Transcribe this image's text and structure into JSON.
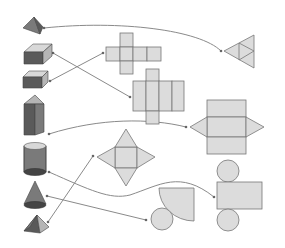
{
  "diagram": {
    "background": "#ffffff",
    "colors": {
      "net_fill": "#dcdcdc",
      "net_stroke": "#777777",
      "solid_dark": "#5a5a5a",
      "connector": "#8a8a8a"
    },
    "solids": [
      {
        "id": "tetrahedron",
        "label": "Triangular pyramid (tetrahedron)"
      },
      {
        "id": "rect-prism",
        "label": "Rectangular prism"
      },
      {
        "id": "cube",
        "label": "Cube"
      },
      {
        "id": "tri-prism",
        "label": "Triangular prism"
      },
      {
        "id": "cylinder",
        "label": "Cylinder"
      },
      {
        "id": "cone",
        "label": "Cone"
      },
      {
        "id": "square-pyramid",
        "label": "Square pyramid"
      }
    ],
    "nets": [
      {
        "id": "net-cube",
        "label": "Cube net (cross of 6 squares)"
      },
      {
        "id": "net-rect-prism",
        "label": "Rectangular prism net"
      },
      {
        "id": "net-tetrahedron",
        "label": "Tetrahedron net (4 triangles)"
      },
      {
        "id": "net-tri-prism",
        "label": "Triangular prism net"
      },
      {
        "id": "net-square-pyramid",
        "label": "Square pyramid net"
      },
      {
        "id": "net-cylinder",
        "label": "Cylinder net (rectangle + 2 circles)"
      },
      {
        "id": "net-cone",
        "label": "Cone net (sector + circle)"
      }
    ],
    "connections": [
      {
        "from": "tetrahedron",
        "to": "net-tetrahedron"
      },
      {
        "from": "rect-prism",
        "to": "net-rect-prism"
      },
      {
        "from": "cube",
        "to": "net-cube"
      },
      {
        "from": "tri-prism",
        "to": "net-tri-prism"
      },
      {
        "from": "cylinder",
        "to": "net-cylinder"
      },
      {
        "from": "cone",
        "to": "net-cone"
      },
      {
        "from": "square-pyramid",
        "to": "net-square-pyramid"
      }
    ]
  }
}
